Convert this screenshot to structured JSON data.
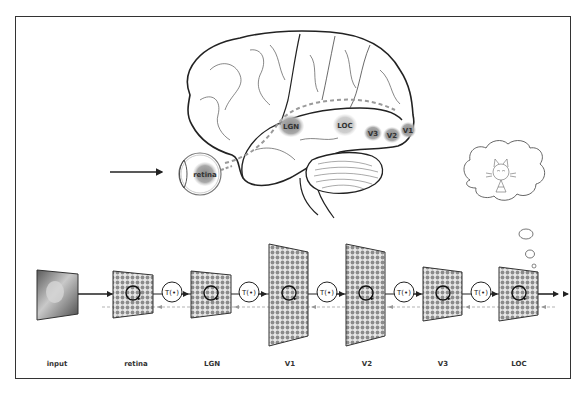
{
  "figure": {
    "brain": {
      "regions": [
        {
          "id": "retina",
          "label": "retina"
        },
        {
          "id": "lgn",
          "label": "LGN"
        },
        {
          "id": "loc",
          "label": "LOC"
        },
        {
          "id": "v3",
          "label": "V3"
        },
        {
          "id": "v2",
          "label": "V2"
        },
        {
          "id": "v1",
          "label": "V1"
        }
      ]
    },
    "pipeline": {
      "stages": [
        {
          "label": "input"
        },
        {
          "label": "retina"
        },
        {
          "label": "LGN"
        },
        {
          "label": "V1"
        },
        {
          "label": "V2"
        },
        {
          "label": "V3"
        },
        {
          "label": "LOC"
        }
      ],
      "transform_label": "T(•)"
    },
    "thought_bubble": {
      "content": "cat-icon"
    },
    "colors": {
      "line": "#222222",
      "region_fill": "#8a8a8a",
      "grid_dot": "#8c8c8c",
      "dashed": "#999999"
    }
  }
}
